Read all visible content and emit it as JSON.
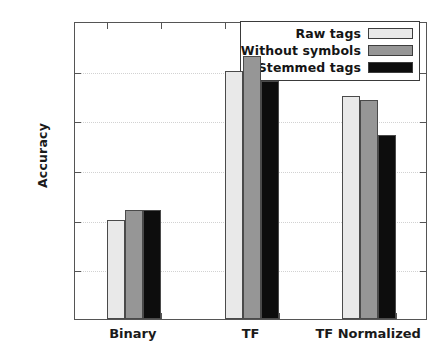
{
  "chart_data": {
    "type": "bar",
    "title": "",
    "xlabel": "",
    "ylabel": "Accuracy",
    "categories": [
      "Binary",
      "TF",
      "TF Normalized"
    ],
    "ylim": [
      60,
      66
    ],
    "yticks": [
      60,
      61,
      62,
      63,
      64,
      65,
      66
    ],
    "ytick_labels": [
      "60",
      "61",
      "62",
      "63",
      "64",
      "65",
      "66"
    ],
    "grid": true,
    "legend_position": "top-right",
    "series": [
      {
        "name": "Raw tags",
        "color": "#e9e9e9",
        "values": [
          62.0,
          65.0,
          64.5
        ]
      },
      {
        "name": "Without symbols",
        "color": "#969696",
        "values": [
          62.2,
          65.3,
          64.4
        ]
      },
      {
        "name": "Stemmed tags",
        "color": "#0d0d0d",
        "values": [
          62.2,
          64.8,
          63.7
        ]
      }
    ]
  },
  "axis": {
    "y_title": "Accuracy"
  },
  "legend": {
    "items": [
      {
        "label": "Raw tags",
        "color": "#e9e9e9"
      },
      {
        "label": "Without symbols",
        "color": "#969696"
      },
      {
        "label": "Stemmed tags",
        "color": "#0d0d0d"
      }
    ]
  },
  "colors": {
    "axis": "#555555",
    "grid": "#d2d2d2",
    "text": "#1a1a1a",
    "background": "#ffffff"
  }
}
